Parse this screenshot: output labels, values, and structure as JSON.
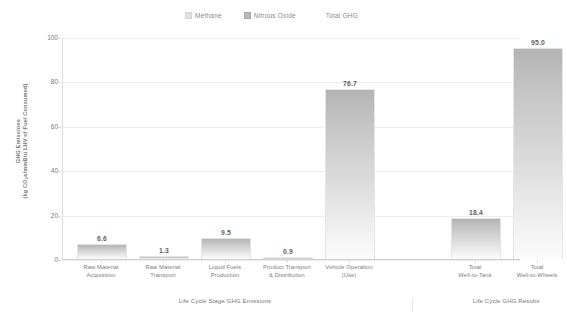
{
  "chart_data": {
    "type": "bar",
    "title": "",
    "xlabel": "",
    "ylabel": "GHG Emissions (kg CO2e/mmBtu LHV of Fuel Consumed)",
    "ylim": [
      0,
      100
    ],
    "yticks": [
      0,
      20,
      40,
      60,
      80,
      100
    ],
    "grid": true,
    "legend_position": "top-center",
    "categories": [
      "Raw Material Acquisition",
      "Raw Material Transport",
      "Liquid Fuels Production",
      "Product Transport & Distribution",
      "Vehicle Operation (Use)",
      "Total Well-to-Tank",
      "Total Well-to-Wheels"
    ],
    "values": [
      6.6,
      1.3,
      9.5,
      0.9,
      76.7,
      18.4,
      95.0
    ],
    "data_labels": [
      "6.6",
      "1.3",
      "9.5",
      "0.9",
      "76.7",
      "18.4",
      "95.0"
    ],
    "legend": [
      "Methane",
      "Nitrous Oxide",
      "Total GHG"
    ],
    "groups": [
      {
        "label": "Life Cycle Stage GHG Emissions",
        "categories": 5
      },
      {
        "label": "Life Cycle GHG Results",
        "categories": 2
      }
    ]
  },
  "axis": {
    "y_title_line1": "GHG Emissions",
    "y_title_line2_pre": "(kg CO",
    "y_title_line2_sub": "2",
    "y_title_line2_post": "e/mmBtu LHV of Fuel Consumed)",
    "ticks": [
      "100",
      "80",
      "60",
      "40",
      "20",
      "0"
    ]
  },
  "xcategories": [
    {
      "line1": "Raw Material",
      "line2": "Acquisition"
    },
    {
      "line1": "Raw Material",
      "line2": "Transport"
    },
    {
      "line1": "Liquid Fuels",
      "line2": "Production"
    },
    {
      "line1": "Product Transport",
      "line2": "& Distribution"
    },
    {
      "line1": "Vehicle Operation",
      "line2": "(Use)"
    },
    {
      "line1": "Total",
      "line2": "Well-to-Tank"
    },
    {
      "line1": "Total",
      "line2": "Well-to-Wheels"
    }
  ],
  "legend": {
    "items": [
      {
        "label": "Methane",
        "marker": "methane-swatch",
        "color": "#e2e2e2"
      },
      {
        "label": "Nitrous Oxide",
        "marker": "nitrous-oxide-swatch",
        "color": "#b9b9b9"
      },
      {
        "label": "Total GHG",
        "marker": "total-ghg-swatch",
        "color": "#ffffff"
      }
    ]
  },
  "group_titles": [
    "Life Cycle Stage GHG Emissions",
    "Life Cycle GHG Results"
  ],
  "colors": {
    "bar_top": "#b4b4b4",
    "bar_bottom": "#fbfbfb",
    "gridline": "#ececec",
    "axis": "#d0d0d0",
    "text": "#7a7a7a",
    "value_text": "#5f5f5f"
  }
}
